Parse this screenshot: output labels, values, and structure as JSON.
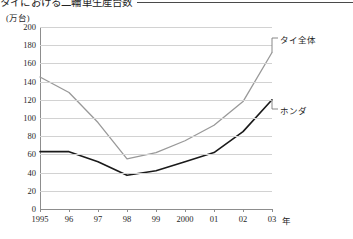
{
  "chart_data": {
    "type": "line",
    "title": "タイにおける二輪車生産台数",
    "subtitle": "",
    "ylabel": "(万台)",
    "xlabel": "年",
    "categories": [
      "1995",
      "96",
      "97",
      "98",
      "99",
      "2000",
      "01",
      "02",
      "03"
    ],
    "ylim": [
      0,
      200
    ],
    "ytick_step": 20,
    "yticks": [
      "200",
      "180",
      "160",
      "140",
      "120",
      "100",
      "80",
      "60",
      "40",
      "20",
      "0"
    ],
    "grid": true,
    "legend_position": "inline-callout",
    "series": [
      {
        "name": "タイ全体",
        "color": "#999999",
        "values": [
          145,
          128,
          95,
          55,
          62,
          75,
          92,
          118,
          172
        ]
      },
      {
        "name": "ホンダ",
        "color": "#1a1a1a",
        "values": [
          63,
          63,
          52,
          37,
          42,
          52,
          62,
          85,
          120
        ]
      }
    ],
    "annotations": [
      {
        "text": "タイ全体",
        "target_series": "タイ全体",
        "target_x": "03"
      },
      {
        "text": "ホンダ",
        "target_series": "ホンダ",
        "target_x": "03"
      }
    ]
  },
  "header": {
    "title": "タイにおける二輪車生産台数"
  },
  "axes": {
    "y_unit_label": "(万台)",
    "x_unit_label": "年"
  }
}
